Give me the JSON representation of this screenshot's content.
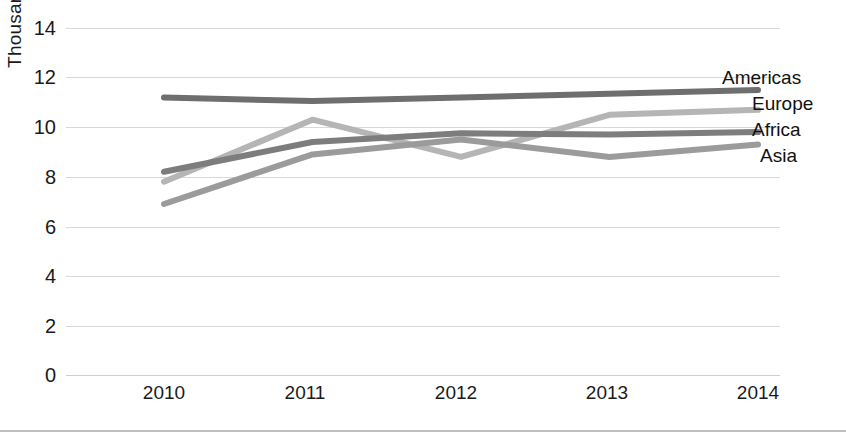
{
  "chart_data": {
    "type": "line",
    "title": "",
    "xlabel": "",
    "ylabel": "Thousands",
    "categories": [
      "2010",
      "2011",
      "2012",
      "2013",
      "2014"
    ],
    "x": [
      2010,
      2011,
      2012,
      2013,
      2014
    ],
    "ylim": [
      0,
      14
    ],
    "y_ticks": [
      0,
      2,
      4,
      6,
      8,
      10,
      12,
      14
    ],
    "y_tick_labels": [
      "0",
      "2",
      "4",
      "6",
      "8",
      "10",
      "12",
      "14"
    ],
    "grid": true,
    "legend_position": "inline-right",
    "series": [
      {
        "name": "Americas",
        "values": [
          11.2,
          11.05,
          11.2,
          11.35,
          11.5
        ],
        "color": "#6e6e6e"
      },
      {
        "name": "Europe",
        "values": [
          7.8,
          10.3,
          8.8,
          10.5,
          10.7
        ],
        "color": "#b5b5b5"
      },
      {
        "name": "Africa",
        "values": [
          8.2,
          9.4,
          9.75,
          9.7,
          9.8
        ],
        "color": "#7d7d7d"
      },
      {
        "name": "Asia",
        "values": [
          6.9,
          8.9,
          9.5,
          8.8,
          9.3
        ],
        "color": "#9b9b9b"
      }
    ]
  },
  "axis": {
    "y_title": "Thousands",
    "y_tick_labels": [
      "14",
      "12",
      "10",
      "8",
      "6",
      "4",
      "2",
      "0"
    ],
    "x_tick_labels": [
      "2010",
      "2011",
      "2012",
      "2013",
      "2014"
    ]
  },
  "labels": {
    "americas": "Americas",
    "europe": "Europe",
    "africa": "Africa",
    "asia": "Asia"
  }
}
